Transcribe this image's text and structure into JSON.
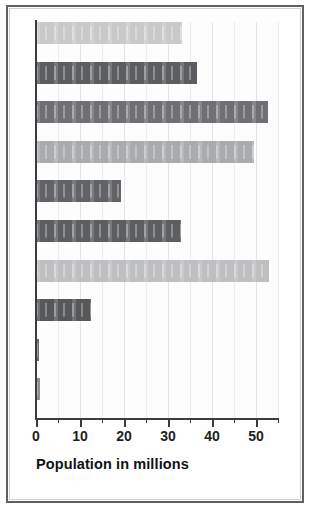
{
  "chart_data": {
    "type": "bar",
    "orientation": "horizontal",
    "title": "",
    "xlabel": "Population in millions",
    "ylabel": "",
    "xlim": [
      0,
      55
    ],
    "ylim": null,
    "grid": true,
    "legend": false,
    "x_ticks_major": [
      0,
      10,
      20,
      30,
      40,
      50
    ],
    "x_ticks_minor": [
      5,
      15,
      25,
      35,
      45,
      55
    ],
    "x_tick_labels": [
      "0",
      "10",
      "20",
      "30",
      "40",
      "50"
    ],
    "categories": [
      "",
      "",
      "",
      "",
      "",
      "",
      "",
      "",
      "",
      ""
    ],
    "values": [
      33.2,
      36.7,
      52.7,
      49.6,
      19.3,
      32.9,
      52.9,
      12.5,
      0.7,
      0.9
    ],
    "bar_colors": [
      "#c9c9c9",
      "#5b5d61",
      "#6e7074",
      "#a9abad",
      "#616367",
      "#5c5e62",
      "#bdbfc1",
      "#555759",
      "#4e5053",
      "#76787b"
    ],
    "values_label": "Population in millions"
  },
  "figure": {
    "frame_color": "#5e6064",
    "background": "#ffffff",
    "axis_color": "#3a3c40",
    "gridline_color": "#ececec",
    "axis_title": "Population in millions"
  }
}
